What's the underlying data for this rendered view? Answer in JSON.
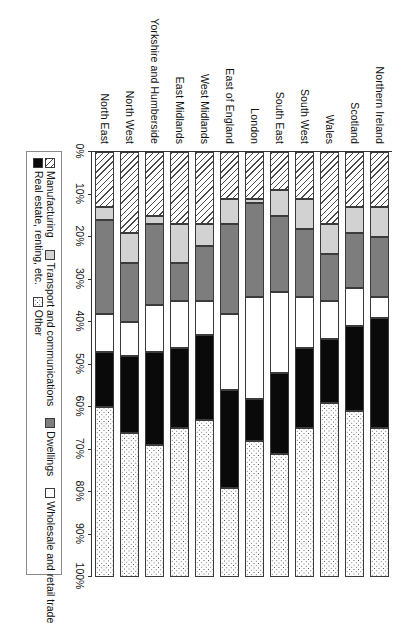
{
  "chart_data": {
    "type": "bar",
    "orientation": "horizontal-stacked",
    "title": "",
    "subtitle": "",
    "xlabel": "",
    "ylabel": "",
    "xlim": [
      0,
      100
    ],
    "grid": false,
    "legend_position": "bottom",
    "axis_tick_labels": [
      "0%",
      "10%",
      "20%",
      "30%",
      "40%",
      "50%",
      "60%",
      "70%",
      "80%",
      "90%",
      "100%"
    ],
    "axis_tick_values": [
      0,
      10,
      20,
      30,
      40,
      50,
      60,
      70,
      80,
      90,
      100
    ],
    "categories": [
      "Northern Ireland",
      "Scotland",
      "Wales",
      "South West",
      "South East",
      "London",
      "East of England",
      "West Midlands",
      "East Midlands",
      "Yorkshire and Humberside",
      "North West",
      "North East"
    ],
    "series": [
      {
        "name": "Manufacturing",
        "fill": "f-manufacturing",
        "swatch_pattern": "diagonal-hatch",
        "values": [
          13,
          13,
          17,
          11,
          9,
          11,
          11,
          17,
          17,
          15,
          19,
          13
        ]
      },
      {
        "name": "Transport and communications",
        "fill": "f-transport",
        "swatch_pattern": "light-grey",
        "values": [
          7,
          6,
          7,
          7,
          6,
          1,
          6,
          5,
          9,
          2,
          7,
          3
        ]
      },
      {
        "name": "Dwellings",
        "fill": "f-dwellings",
        "swatch_pattern": "dark-grey",
        "values": [
          14,
          13,
          11,
          16,
          18,
          22,
          21,
          13,
          9,
          19,
          14,
          22
        ]
      },
      {
        "name": "Wholesale and retail trade",
        "fill": "f-wholesale",
        "swatch_pattern": "white",
        "values": [
          5,
          9,
          9,
          12,
          19,
          24,
          18,
          8,
          11,
          11,
          8,
          9
        ]
      },
      {
        "name": "Real estate, renting, etc.",
        "fill": "f-realestate",
        "swatch_pattern": "black",
        "values": [
          26,
          20,
          15,
          19,
          19,
          10,
          23,
          20,
          19,
          22,
          18,
          13
        ]
      },
      {
        "name": "Other",
        "fill": "f-other",
        "swatch_pattern": "dotted",
        "values": [
          35,
          39,
          41,
          35,
          29,
          32,
          21,
          37,
          35,
          31,
          34,
          40
        ]
      }
    ]
  },
  "legend": {
    "row1": [
      "Manufacturing",
      "Transport and communications",
      "Dwellings",
      "Wholesale and retail trade"
    ],
    "row2": [
      "Real estate, renting, etc.",
      "Other"
    ]
  },
  "colors": {
    "manufacturing": "#ffffff",
    "transport": "#d2d2d2",
    "dwellings": "#7d7d7d",
    "wholesale": "#ffffff",
    "real_estate": "#0a0a0a",
    "other": "#ffffff",
    "outline": "#3b3b3b",
    "axis": "#333333"
  }
}
